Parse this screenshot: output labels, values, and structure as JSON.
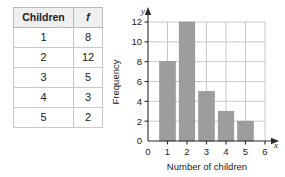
{
  "table": {
    "headers": [
      "Children",
      "f"
    ],
    "rows": [
      {
        "children": "1",
        "f": "8"
      },
      {
        "children": "2",
        "f": "12"
      },
      {
        "children": "3",
        "f": "5"
      },
      {
        "children": "4",
        "f": "3"
      },
      {
        "children": "5",
        "f": "2"
      }
    ]
  },
  "chart_data": {
    "type": "bar",
    "title": "",
    "xlabel": "Number of children",
    "ylabel": "Frequency",
    "categories": [
      "1",
      "2",
      "3",
      "4",
      "5"
    ],
    "values": [
      8,
      12,
      5,
      3,
      2
    ],
    "xlim": [
      0,
      6
    ],
    "ylim": [
      0,
      12
    ],
    "xticks": [
      "0",
      "1",
      "2",
      "3",
      "4",
      "5",
      "6"
    ],
    "yticks": [
      "0",
      "2",
      "4",
      "6",
      "8",
      "10",
      "12"
    ],
    "grid": true,
    "legend": "none",
    "x_axis_symbol": "x",
    "y_axis_symbol": "y",
    "bar_color": "#9d9d9d",
    "grid_color": "#bdbdbd",
    "axis_color": "#2a2a2a"
  }
}
